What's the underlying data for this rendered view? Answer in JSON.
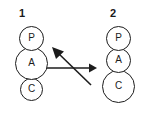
{
  "diagram": {
    "background_color": "#ffffff",
    "stroke_color": "#1c1c1c",
    "structures": [
      {
        "label": "1",
        "nodes": [
          {
            "letter": "P",
            "name": "node-p",
            "size": "small"
          },
          {
            "letter": "A",
            "name": "node-a",
            "size": "large"
          },
          {
            "letter": "C",
            "name": "node-c",
            "size": "small"
          }
        ]
      },
      {
        "label": "2",
        "nodes": [
          {
            "letter": "P",
            "name": "node-p",
            "size": "small"
          },
          {
            "letter": "A",
            "name": "node-a",
            "size": "small"
          },
          {
            "letter": "C",
            "name": "node-c",
            "size": "large"
          }
        ]
      }
    ],
    "arrows": {
      "name": "equilibrium-arrows",
      "forward": {
        "direction": "right",
        "style": "straight-horizontal"
      },
      "reverse": {
        "direction": "up-left",
        "style": "diagonal"
      }
    }
  }
}
